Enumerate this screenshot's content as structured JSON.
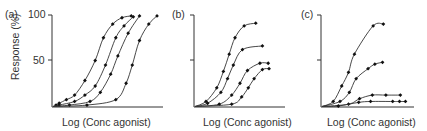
{
  "chart_data": [
    {
      "panel": "(a)",
      "type": "line",
      "title": "",
      "xlabel": "Log (Conc agonist)",
      "ylabel": "Response (%)",
      "ylim": [
        0,
        100
      ],
      "yticks": [
        50,
        100
      ],
      "grid": false,
      "legend": null,
      "series": [
        {
          "name": "curve 1",
          "x": [
            0.02,
            0.05,
            0.12,
            0.2,
            0.3,
            0.4,
            0.48,
            0.57,
            0.66,
            0.75
          ],
          "values": [
            1,
            3,
            7,
            12,
            28,
            50,
            75,
            90,
            97,
            99
          ]
        },
        {
          "name": "curve 2",
          "x": [
            0.05,
            0.2,
            0.3,
            0.4,
            0.5,
            0.6,
            0.68,
            0.77
          ],
          "values": [
            1,
            5,
            12,
            22,
            45,
            75,
            88,
            98
          ]
        },
        {
          "name": "curve 3",
          "x": [
            0.15,
            0.35,
            0.45,
            0.55,
            0.62,
            0.72,
            0.83
          ],
          "values": [
            1,
            5,
            15,
            35,
            55,
            80,
            99
          ]
        },
        {
          "name": "curve 4",
          "x": [
            0.32,
            0.6,
            0.7,
            0.76,
            0.83,
            0.92,
            1.0
          ],
          "values": [
            1,
            7,
            25,
            45,
            72,
            90,
            99
          ]
        }
      ]
    },
    {
      "panel": "(b)",
      "type": "line",
      "title": "",
      "xlabel": "Log (Conc agonist)",
      "ylabel": "",
      "ylim": [
        0,
        100
      ],
      "yticks": [
        50,
        100
      ],
      "grid": false,
      "legend": null,
      "series": [
        {
          "name": "curve 1",
          "x": [
            0.12,
            0.25,
            0.33,
            0.4,
            0.47,
            0.58,
            0.72
          ],
          "values": [
            5,
            20,
            38,
            57,
            75,
            88,
            91
          ]
        },
        {
          "name": "curve 2",
          "x": [
            0.14,
            0.3,
            0.38,
            0.45,
            0.56,
            0.8
          ],
          "values": [
            3,
            15,
            30,
            45,
            62,
            66
          ]
        },
        {
          "name": "curve 3",
          "x": [
            0.28,
            0.43,
            0.53,
            0.62,
            0.77,
            0.87
          ],
          "values": [
            2,
            12,
            25,
            39,
            47,
            47
          ]
        },
        {
          "name": "curve 4",
          "x": [
            0.43,
            0.55,
            0.63,
            0.7,
            0.8,
            0.88
          ],
          "values": [
            2,
            10,
            20,
            30,
            40,
            41
          ]
        }
      ]
    },
    {
      "panel": "(c)",
      "type": "line",
      "title": "",
      "xlabel": "Log (Conc agonist)",
      "ylabel": "",
      "ylim": [
        0,
        100
      ],
      "yticks": [
        50,
        100
      ],
      "grid": false,
      "legend": null,
      "series": [
        {
          "name": "curve 1",
          "x": [
            0.12,
            0.22,
            0.3,
            0.37,
            0.59,
            0.71
          ],
          "values": [
            5,
            22,
            37,
            57,
            88,
            90
          ]
        },
        {
          "name": "curve 2",
          "x": [
            0.2,
            0.31,
            0.39,
            0.53,
            0.61,
            0.7
          ],
          "values": [
            5,
            15,
            30,
            41,
            46,
            48
          ]
        },
        {
          "name": "curve 3",
          "x": [
            0.3,
            0.43,
            0.58,
            0.74,
            0.91
          ],
          "values": [
            2,
            8,
            12,
            12,
            12
          ]
        },
        {
          "name": "curve 4",
          "x": [
            0.18,
            0.42,
            0.56,
            0.82,
            0.9,
            0.97
          ],
          "values": [
            0,
            4,
            5,
            5,
            5,
            5
          ]
        }
      ]
    }
  ],
  "panels": [
    {
      "label": "(a)",
      "xlabel": "Log (Conc agonist)",
      "ylabel": "Response (%)",
      "tick_top": "100",
      "tick_mid": "50"
    },
    {
      "label": "(b)",
      "xlabel": "Log (Conc agonist)"
    },
    {
      "label": "(c)",
      "xlabel": "Log (Conc agonist)"
    }
  ]
}
